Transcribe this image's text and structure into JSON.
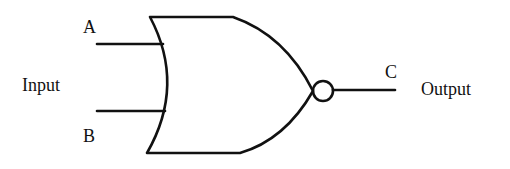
{
  "diagram": {
    "type": "logic-gate",
    "gate": "NOR",
    "stroke_color": "#111111",
    "background": "#ffffff",
    "inputs": [
      {
        "name": "A"
      },
      {
        "name": "B"
      }
    ],
    "output": {
      "name": "C"
    },
    "labels": {
      "input_group": "Input",
      "input_a": "A",
      "input_b": "B",
      "output_name": "C",
      "output_group": "Output"
    }
  }
}
